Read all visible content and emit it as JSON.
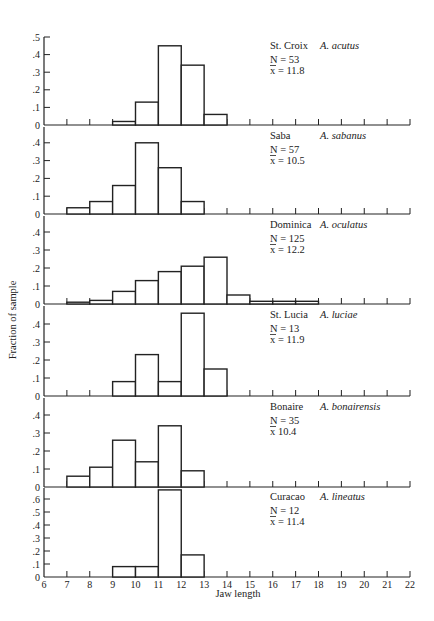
{
  "chart_data": {
    "type": "bar",
    "subtype": "stacked-histograms",
    "title": "",
    "xlabel": "Jaw length",
    "ylabel": "Fraction of sample",
    "xlim": [
      6,
      22
    ],
    "x_ticks": [
      6,
      7,
      8,
      9,
      10,
      11,
      12,
      13,
      14,
      15,
      16,
      17,
      18,
      19,
      20,
      21,
      22
    ],
    "bin_width": 1,
    "grid": false,
    "panels": [
      {
        "island": "St. Croix",
        "species": "A. acutus",
        "n_label": "N = 53",
        "mean_label": "x = 11.8",
        "ylim": [
          0,
          0.5
        ],
        "y_ticks": [
          0,
          0.1,
          0.2,
          0.3,
          0.4,
          0.5
        ],
        "y_tick_labels": [
          "0",
          ".1",
          ".2",
          ".3",
          ".4",
          ".5"
        ],
        "bins": [
          {
            "start": 9,
            "value": 0.02
          },
          {
            "start": 10,
            "value": 0.13
          },
          {
            "start": 11,
            "value": 0.45
          },
          {
            "start": 12,
            "value": 0.34
          },
          {
            "start": 13,
            "value": 0.06
          }
        ]
      },
      {
        "island": "Saba",
        "species": "A. sabanus",
        "n_label": "N = 57",
        "mean_label": "x = 10.5",
        "ylim": [
          0,
          0.4
        ],
        "y_ticks": [
          0,
          0.1,
          0.2,
          0.3,
          0.4
        ],
        "y_tick_labels": [
          "0",
          ".1",
          ".2",
          ".3",
          ".4"
        ],
        "bins": [
          {
            "start": 7,
            "value": 0.035
          },
          {
            "start": 8,
            "value": 0.07
          },
          {
            "start": 9,
            "value": 0.16
          },
          {
            "start": 10,
            "value": 0.4
          },
          {
            "start": 11,
            "value": 0.26
          },
          {
            "start": 12,
            "value": 0.07
          }
        ]
      },
      {
        "island": "Dominica",
        "species": "A. oculatus",
        "n_label": "N = 125",
        "mean_label": "x = 12.2",
        "ylim": [
          0,
          0.4
        ],
        "y_ticks": [
          0,
          0.1,
          0.2,
          0.3,
          0.4
        ],
        "y_tick_labels": [
          "0",
          ".1",
          ".2",
          ".3",
          ".4"
        ],
        "bins": [
          {
            "start": 7,
            "value": 0.01
          },
          {
            "start": 8,
            "value": 0.02
          },
          {
            "start": 9,
            "value": 0.07
          },
          {
            "start": 10,
            "value": 0.13
          },
          {
            "start": 11,
            "value": 0.18
          },
          {
            "start": 12,
            "value": 0.21
          },
          {
            "start": 13,
            "value": 0.26
          },
          {
            "start": 14,
            "value": 0.05
          },
          {
            "start": 15,
            "value": 0.015
          },
          {
            "start": 16,
            "value": 0.015
          },
          {
            "start": 17,
            "value": 0.015
          }
        ]
      },
      {
        "island": "St. Lucia",
        "species": "A. luciae",
        "n_label": "N = 13",
        "mean_label": "x = 11.9",
        "ylim": [
          0,
          0.4
        ],
        "y_ticks": [
          0,
          0.1,
          0.2,
          0.3,
          0.4
        ],
        "y_tick_labels": [
          "0",
          ".1",
          ".2",
          ".3",
          ".4"
        ],
        "bins": [
          {
            "start": 9,
            "value": 0.08
          },
          {
            "start": 10,
            "value": 0.23
          },
          {
            "start": 11,
            "value": 0.08
          },
          {
            "start": 12,
            "value": 0.46
          },
          {
            "start": 13,
            "value": 0.15
          }
        ]
      },
      {
        "island": "Bonaire",
        "species": "A. bonairensis",
        "n_label": "N = 35",
        "mean_label": "x 10.4",
        "ylim": [
          0,
          0.4
        ],
        "y_ticks": [
          0,
          0.1,
          0.2,
          0.3,
          0.4
        ],
        "y_tick_labels": [
          "0",
          ".1",
          ".2",
          ".3",
          ".4"
        ],
        "bins": [
          {
            "start": 7,
            "value": 0.06
          },
          {
            "start": 8,
            "value": 0.11
          },
          {
            "start": 9,
            "value": 0.26
          },
          {
            "start": 10,
            "value": 0.14
          },
          {
            "start": 11,
            "value": 0.34
          },
          {
            "start": 12,
            "value": 0.09
          }
        ]
      },
      {
        "island": "Curacao",
        "species": "A. lineatus",
        "n_label": "N = 12",
        "mean_label": "x = 11.4",
        "ylim": [
          0,
          0.6
        ],
        "y_ticks": [
          0,
          0.1,
          0.2,
          0.3,
          0.4,
          0.5,
          0.6
        ],
        "y_tick_labels": [
          "0",
          ".1",
          ".2",
          ".3",
          ".4",
          ".5",
          ".6"
        ],
        "bins": [
          {
            "start": 9,
            "value": 0.08
          },
          {
            "start": 10,
            "value": 0.08
          },
          {
            "start": 11,
            "value": 0.67
          },
          {
            "start": 12,
            "value": 0.17
          }
        ]
      }
    ]
  }
}
